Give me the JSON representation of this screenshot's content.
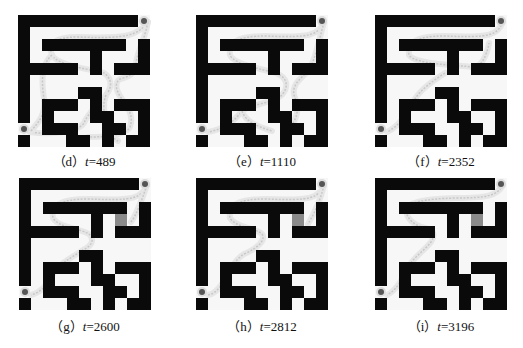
{
  "figure": {
    "grid": {
      "rows": 11,
      "cols": 11,
      "cell_px": 12,
      "walls": [
        [
          0,
          0
        ],
        [
          0,
          1
        ],
        [
          0,
          2
        ],
        [
          0,
          3
        ],
        [
          0,
          4
        ],
        [
          0,
          5
        ],
        [
          0,
          6
        ],
        [
          0,
          7
        ],
        [
          0,
          8
        ],
        [
          0,
          9
        ],
        [
          1,
          0
        ],
        [
          2,
          0
        ],
        [
          2,
          2
        ],
        [
          2,
          3
        ],
        [
          2,
          4
        ],
        [
          2,
          5
        ],
        [
          2,
          6
        ],
        [
          2,
          7
        ],
        [
          2,
          8
        ],
        [
          2,
          10
        ],
        [
          3,
          0
        ],
        [
          3,
          6
        ],
        [
          3,
          10
        ],
        [
          4,
          0
        ],
        [
          4,
          1
        ],
        [
          4,
          2
        ],
        [
          4,
          3
        ],
        [
          4,
          4
        ],
        [
          4,
          6
        ],
        [
          4,
          8
        ],
        [
          4,
          9
        ],
        [
          4,
          10
        ],
        [
          5,
          0
        ],
        [
          6,
          0
        ],
        [
          6,
          5
        ],
        [
          6,
          6
        ],
        [
          7,
          0
        ],
        [
          7,
          2
        ],
        [
          7,
          3
        ],
        [
          7,
          4
        ],
        [
          7,
          6
        ],
        [
          7,
          8
        ],
        [
          7,
          9
        ],
        [
          7,
          10
        ],
        [
          8,
          0
        ],
        [
          8,
          2
        ],
        [
          8,
          6
        ],
        [
          8,
          7
        ],
        [
          8,
          10
        ],
        [
          9,
          2
        ],
        [
          9,
          3
        ],
        [
          9,
          4
        ],
        [
          9,
          7
        ],
        [
          9,
          8
        ],
        [
          9,
          10
        ],
        [
          10,
          0
        ],
        [
          10,
          4
        ],
        [
          10,
          5
        ],
        [
          10,
          7
        ],
        [
          10,
          9
        ],
        [
          10,
          10
        ]
      ],
      "goal": [
        0,
        10
      ],
      "start": [
        9,
        0
      ]
    },
    "colors": {
      "wall": "#0a0a0a",
      "floor": "#f7f7f7",
      "path": "#c8c8c8",
      "marker": "#555555",
      "shaded_cell": "#8a8a8a"
    },
    "panels": [
      {
        "id": "d",
        "label": "（d）",
        "t_var": "t",
        "t_value": "=489",
        "shaded": [],
        "paths": [
          "M130,7 C120,20 110,24 60,22 C35,22 30,30 34,40 C40,52 80,55 86,58 C92,62 96,70 88,80 C80,90 70,98 66,108 C60,118 30,120 12,117",
          "M130,7 C125,30 118,40 118,50 C118,58 110,62 102,64 C96,68 98,76 104,84 C110,94 116,100 112,112 C108,120 90,122 70,122",
          "M88,80 C84,90 86,100 90,112 C92,120 96,124 100,126",
          "M34,40 C22,50 24,70 26,84 C28,100 20,108 12,117"
        ]
      },
      {
        "id": "e",
        "label": "（e）",
        "t_var": "t",
        "t_value": "=1110",
        "shaded": [],
        "paths": [
          "M128,7 C122,20 115,23 70,21 C40,21 32,28 34,40 C38,50 70,55 80,58 C90,62 94,70 86,80 C78,88 52,90 46,96 C40,104 30,114 12,117",
          "M128,7 C122,30 118,48 112,56 C104,64 96,70 98,80 C102,90 104,100 94,112",
          "M46,96 C50,108 64,112 76,116"
        ]
      },
      {
        "id": "f",
        "label": "（f）",
        "t_var": "t",
        "t_value": "=2352",
        "shaded": [],
        "paths": [
          "M128,7 C122,20 116,23 70,21 C40,21 32,28 34,40 C40,50 86,50 96,52 C106,54 112,40 114,28",
          "M70,58 C58,66 46,74 40,84 C34,96 26,110 12,117"
        ]
      },
      {
        "id": "g",
        "label": "（g）",
        "t_var": "t",
        "t_value": "=2600",
        "shaded": [
          [
            3,
            8
          ]
        ],
        "paths": [
          "M128,7 C122,20 116,23 70,21 C40,21 32,28 34,40 C40,50 60,50 70,56 C74,60 76,66 64,72 C52,80 40,86 34,96 C28,108 22,114 12,117",
          "M128,7 C122,24 118,36 112,44"
        ]
      },
      {
        "id": "h",
        "label": "（h）",
        "t_var": "t",
        "t_value": "=2812",
        "shaded": [
          [
            3,
            8
          ]
        ],
        "paths": [
          "M128,7 C122,20 116,23 70,21 C40,21 32,28 34,40 C40,50 60,50 66,56 C70,62 62,70 48,76 C38,82 32,96 26,106 C22,112 18,116 12,117",
          "M128,7 C124,24 118,36 112,46"
        ]
      },
      {
        "id": "i",
        "label": "（i）",
        "t_var": "t",
        "t_value": "=3196",
        "shaded": [
          [
            3,
            8
          ]
        ],
        "paths": [
          "M128,7 C122,18 112,20 80,20 C50,21 32,24 32,32 C30,40 40,48 50,50 C60,52 60,58 56,64 C50,72 40,78 34,88 C28,100 22,112 12,117"
        ]
      }
    ]
  }
}
